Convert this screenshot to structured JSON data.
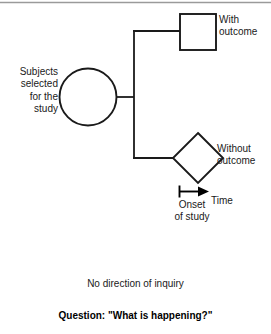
{
  "figure": {
    "title_bar_rule": true,
    "background_color": "#ffffff",
    "stroke_color": "#1a1a1a",
    "labels": {
      "subjects": "Subjects\nselected\nfor the\nstudy",
      "with_outcome": "With\noutcome",
      "without_outcome": "Without\noutcome",
      "onset": "Onset\nof study",
      "time": "Time",
      "no_direction": "No direction of inquiry",
      "question": "Question:  \"What is happening?\""
    },
    "nodes": [
      {
        "name": "subjects-circle",
        "shape": "circle",
        "cx": 88,
        "cy": 97,
        "r": 29
      },
      {
        "name": "with-outcome-square",
        "shape": "square",
        "x": 180,
        "y": 14,
        "size": 36
      },
      {
        "name": "without-outcome-diamond",
        "shape": "diamond",
        "cx": 198,
        "cy": 158,
        "half": 25
      }
    ],
    "connectors": {
      "stub_from_circle": {
        "x1": 117,
        "y1": 97,
        "x2": 134,
        "y2": 97
      },
      "trunk": {
        "x": 134,
        "y1": 31,
        "y2": 158
      },
      "branch_top": {
        "x1": 134,
        "y1": 31,
        "x2": 180,
        "y2": 31
      },
      "branch_bottom": {
        "x1": 134,
        "y1": 158,
        "x2": 173,
        "y2": 158
      }
    },
    "time_axis": {
      "tick_x": 179,
      "tick_y1": 186,
      "tick_y2": 197,
      "line_x2": 200,
      "line_y": 191,
      "arrow_tip_x": 208
    }
  }
}
